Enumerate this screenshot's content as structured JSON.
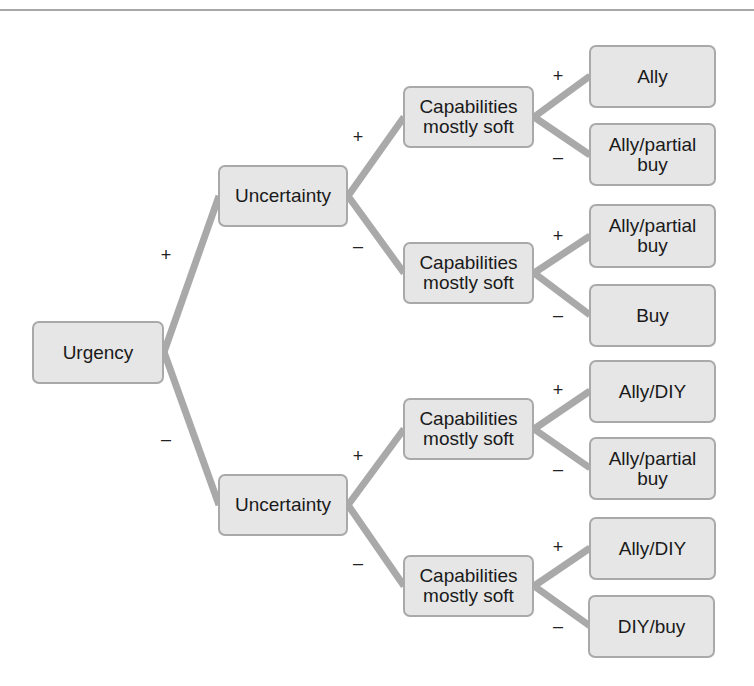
{
  "diagram": {
    "type": "decision-tree",
    "colors": {
      "box_fill": "#e6e6e6",
      "box_border": "#a9a9a9",
      "edge": "#a9a9a9",
      "text": "#1a1a1a"
    },
    "root": {
      "label": "Urgency"
    },
    "level1": [
      {
        "label": "Uncertainty",
        "branch": "+"
      },
      {
        "label": "Uncertainty",
        "branch": "–"
      }
    ],
    "level2": [
      {
        "label": "Capabilities\nmostly soft",
        "branch": "+"
      },
      {
        "label": "Capabilities\nmostly soft",
        "branch": "–"
      },
      {
        "label": "Capabilities\nmostly soft",
        "branch": "+"
      },
      {
        "label": "Capabilities\nmostly soft",
        "branch": "–"
      }
    ],
    "leaves": [
      {
        "label": "Ally",
        "branch": "+"
      },
      {
        "label": "Ally/partial\nbuy",
        "branch": "–"
      },
      {
        "label": "Ally/partial\nbuy",
        "branch": "+"
      },
      {
        "label": "Buy",
        "branch": "–"
      },
      {
        "label": "Ally/DIY",
        "branch": "+"
      },
      {
        "label": "Ally/partial\nbuy",
        "branch": "–"
      },
      {
        "label": "Ally/DIY",
        "branch": "+"
      },
      {
        "label": "DIY/buy",
        "branch": "–"
      }
    ]
  }
}
